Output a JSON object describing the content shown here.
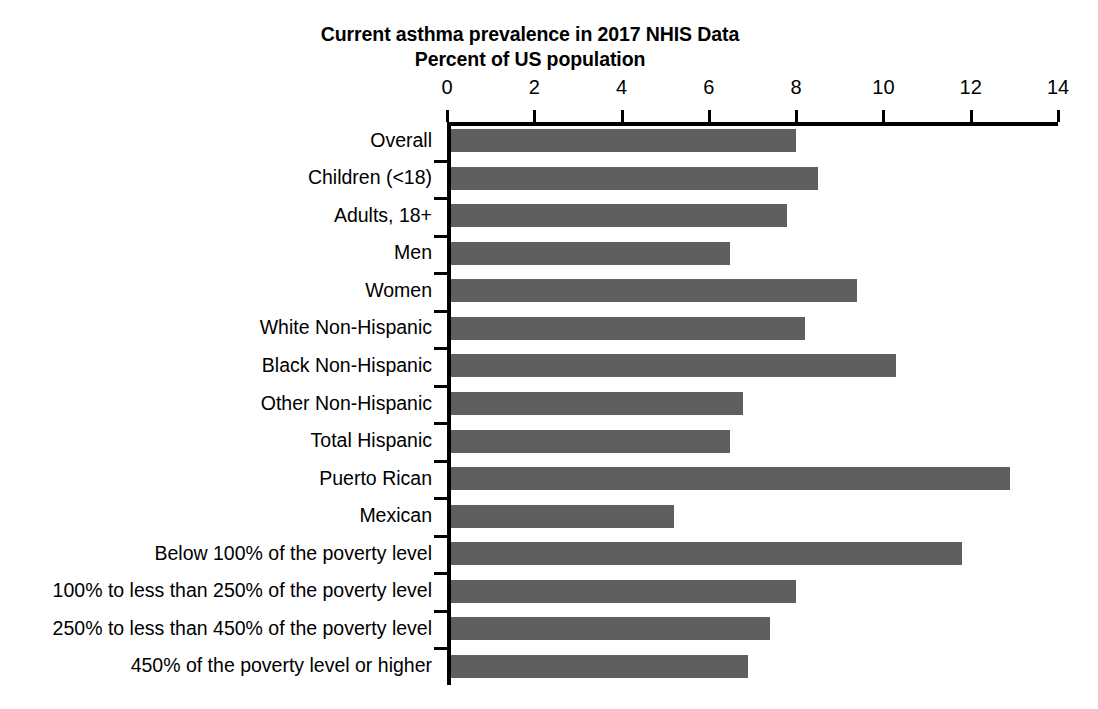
{
  "chart": {
    "title_line1": "Current asthma prevalence in 2017 NHIS Data",
    "title_line2": "Percent of US population",
    "bar_color": "#5f5f5f",
    "axis_color": "#000000"
  },
  "chart_data": {
    "type": "bar",
    "orientation": "horizontal",
    "title": "Current asthma prevalence in 2017 NHIS Data\nPercent of US population",
    "xlabel": "",
    "ylabel": "",
    "xlim": [
      0,
      14
    ],
    "xticks": [
      0,
      2,
      4,
      6,
      8,
      10,
      12,
      14
    ],
    "xtick_labels": [
      "0",
      "2",
      "4",
      "6",
      "8",
      "10",
      "12",
      "14"
    ],
    "grid": false,
    "legend": false,
    "axis_position": "top",
    "categories": [
      "Overall",
      "Children (<18)",
      "Adults, 18+",
      "Men",
      "Women",
      "White Non-Hispanic",
      "Black Non-Hispanic",
      "Other Non-Hispanic",
      "Total Hispanic",
      "Puerto Rican",
      "Mexican",
      "Below 100% of the poverty level",
      "100% to less than 250% of the poverty level",
      "250% to less than 450% of the poverty level",
      "450% of the poverty level or higher"
    ],
    "values": [
      7.9,
      8.4,
      7.7,
      6.4,
      9.3,
      8.1,
      10.2,
      6.7,
      6.4,
      12.8,
      5.1,
      11.7,
      7.9,
      7.3,
      6.8
    ],
    "units": "percent"
  }
}
